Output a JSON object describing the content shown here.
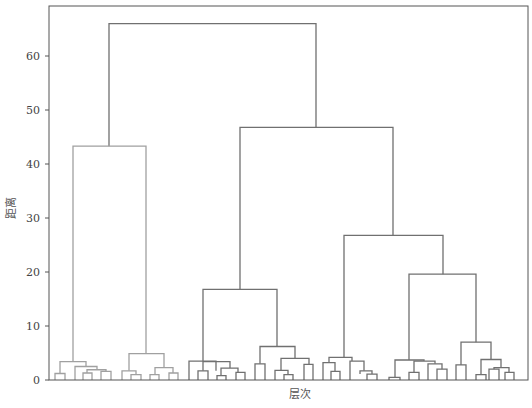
{
  "chart_data": {
    "type": "dendrogram",
    "title": "",
    "xlabel": "层次",
    "ylabel": "距离",
    "ylim": [
      0,
      68
    ],
    "yticks": [
      0,
      10,
      20,
      30,
      40,
      50,
      60
    ],
    "grid": false,
    "legend": null,
    "colors": {
      "cluster_left": "#a0a0a0",
      "cluster_main": "#707070",
      "axis": "#555555"
    },
    "top_merges": [
      {
        "name": "root",
        "height": 66.0
      },
      {
        "name": "left-cluster",
        "height": 43.3
      },
      {
        "name": "right-cluster",
        "height": 46.8
      },
      {
        "name": "right-sub-a",
        "height": 16.8
      },
      {
        "name": "right-sub-b",
        "height": 26.8
      },
      {
        "name": "right-sub-b2",
        "height": 19.6
      },
      {
        "name": "right-sub-a2",
        "height": 6.2
      },
      {
        "name": "right-sub-b2-inner",
        "height": 7.0
      },
      {
        "name": "left-sub-right",
        "height": 4.9
      },
      {
        "name": "left-sub-left",
        "height": 3.5
      }
    ],
    "links": [
      {
        "x1": 109,
        "x2": 316,
        "top": 66.0,
        "b1": 43.3,
        "b2": 46.8,
        "c": "main"
      },
      {
        "x1": 73,
        "x2": 146,
        "top": 43.3,
        "b1": 3.4,
        "b2": 4.9,
        "c": "left"
      },
      {
        "x1": 240,
        "x2": 393,
        "top": 46.8,
        "b1": 16.8,
        "b2": 26.8,
        "c": "main"
      },
      {
        "x1": 203,
        "x2": 277,
        "top": 16.8,
        "b1": 3.5,
        "b2": 6.2,
        "c": "main"
      },
      {
        "x1": 344,
        "x2": 443,
        "top": 26.8,
        "b1": 4.2,
        "b2": 19.6,
        "c": "main"
      },
      {
        "x1": 409,
        "x2": 476,
        "top": 19.6,
        "b1": 3.7,
        "b2": 7.0,
        "c": "main"
      },
      {
        "x1": 60,
        "x2": 86,
        "top": 3.4,
        "b1": 1.2,
        "b2": 2.5,
        "c": "left"
      },
      {
        "x1": 55,
        "x2": 65,
        "top": 1.2,
        "b1": 0,
        "b2": 0,
        "c": "left"
      },
      {
        "x1": 75,
        "x2": 97,
        "top": 2.5,
        "b1": 0,
        "b2": 1.9,
        "c": "left"
      },
      {
        "x1": 87,
        "x2": 106,
        "top": 1.9,
        "b1": 1.3,
        "b2": 1.6,
        "c": "left"
      },
      {
        "x1": 83,
        "x2": 92,
        "top": 1.3,
        "b1": 0,
        "b2": 0,
        "c": "left"
      },
      {
        "x1": 101,
        "x2": 111,
        "top": 1.6,
        "b1": 0,
        "b2": 0,
        "c": "left"
      },
      {
        "x1": 129,
        "x2": 164,
        "top": 4.9,
        "b1": 1.7,
        "b2": 2.3,
        "c": "left"
      },
      {
        "x1": 122,
        "x2": 136,
        "top": 1.7,
        "b1": 0,
        "b2": 1.0,
        "c": "left"
      },
      {
        "x1": 131,
        "x2": 141,
        "top": 1.0,
        "b1": 0,
        "b2": 0,
        "c": "left"
      },
      {
        "x1": 155,
        "x2": 173,
        "top": 2.3,
        "b1": 1.0,
        "b2": 1.3,
        "c": "left"
      },
      {
        "x1": 150,
        "x2": 159,
        "top": 1.0,
        "b1": 0,
        "b2": 0,
        "c": "left"
      },
      {
        "x1": 169,
        "x2": 178,
        "top": 1.3,
        "b1": 0,
        "b2": 0,
        "c": "left"
      },
      {
        "x1": 189,
        "x2": 216,
        "top": 3.5,
        "b1": 0,
        "b2": 1.7,
        "c": "main"
      },
      {
        "x1": 203,
        "x2": 230,
        "top": 3.4,
        "b1": 1.7,
        "b2": 2.2,
        "c": "main"
      },
      {
        "x1": 198,
        "x2": 208,
        "top": 1.7,
        "b1": 0,
        "b2": 0,
        "c": "main"
      },
      {
        "x1": 221,
        "x2": 238,
        "top": 2.2,
        "b1": 0.8,
        "b2": 1.4,
        "c": "main"
      },
      {
        "x1": 217,
        "x2": 226,
        "top": 0.8,
        "b1": 0,
        "b2": 0,
        "c": "main"
      },
      {
        "x1": 236,
        "x2": 245,
        "top": 1.4,
        "b1": 0,
        "b2": 0,
        "c": "main"
      },
      {
        "x1": 260,
        "x2": 295,
        "top": 6.2,
        "b1": 3.0,
        "b2": 4.0,
        "c": "main"
      },
      {
        "x1": 255,
        "x2": 265,
        "top": 3.0,
        "b1": 0,
        "b2": 0,
        "c": "main"
      },
      {
        "x1": 281,
        "x2": 309,
        "top": 4.0,
        "b1": 1.8,
        "b2": 2.9,
        "c": "main"
      },
      {
        "x1": 275,
        "x2": 288,
        "top": 1.8,
        "b1": 0,
        "b2": 1.0,
        "c": "main"
      },
      {
        "x1": 284,
        "x2": 293,
        "top": 1.0,
        "b1": 0,
        "b2": 0,
        "c": "main"
      },
      {
        "x1": 304,
        "x2": 313,
        "top": 2.9,
        "b1": 0,
        "b2": 0,
        "c": "main"
      },
      {
        "x1": 329,
        "x2": 352,
        "top": 4.2,
        "b1": 3.2,
        "b2": 3.5,
        "c": "main"
      },
      {
        "x1": 323,
        "x2": 335,
        "top": 3.2,
        "b1": 0,
        "b2": 1.6,
        "c": "main"
      },
      {
        "x1": 331,
        "x2": 340,
        "top": 1.6,
        "b1": 0,
        "b2": 0,
        "c": "main"
      },
      {
        "x1": 350,
        "x2": 364,
        "top": 3.5,
        "b1": 0,
        "b2": 1.7,
        "c": "main"
      },
      {
        "x1": 360,
        "x2": 372,
        "top": 1.7,
        "b1": 1.1,
        "b2": 1.1,
        "c": "main"
      },
      {
        "x1": 367,
        "x2": 377,
        "top": 1.1,
        "b1": 0,
        "b2": 0,
        "c": "main"
      },
      {
        "x1": 395,
        "x2": 424,
        "top": 3.7,
        "b1": 0.5,
        "b2": 3.5,
        "c": "main"
      },
      {
        "x1": 389,
        "x2": 400,
        "top": 0.5,
        "b1": 0,
        "b2": 0,
        "c": "main"
      },
      {
        "x1": 414,
        "x2": 435,
        "top": 3.5,
        "b1": 1.4,
        "b2": 3.0,
        "c": "main"
      },
      {
        "x1": 409,
        "x2": 419,
        "top": 1.4,
        "b1": 0,
        "b2": 0,
        "c": "main"
      },
      {
        "x1": 428,
        "x2": 442,
        "top": 3.0,
        "b1": 0,
        "b2": 2.0,
        "c": "main"
      },
      {
        "x1": 437,
        "x2": 447,
        "top": 2.0,
        "b1": 0,
        "b2": 0,
        "c": "main"
      },
      {
        "x1": 461,
        "x2": 491,
        "top": 7.0,
        "b1": 2.8,
        "b2": 3.8,
        "c": "main"
      },
      {
        "x1": 456,
        "x2": 466,
        "top": 2.8,
        "b1": 0,
        "b2": 0,
        "c": "main"
      },
      {
        "x1": 481,
        "x2": 501,
        "top": 3.8,
        "b1": 1.0,
        "b2": 2.3,
        "c": "main"
      },
      {
        "x1": 476,
        "x2": 486,
        "top": 1.0,
        "b1": 0,
        "b2": 0,
        "c": "main"
      },
      {
        "x1": 494,
        "x2": 509,
        "top": 2.3,
        "b1": 2.0,
        "b2": 1.4,
        "c": "main"
      },
      {
        "x1": 489,
        "x2": 499,
        "top": 2.0,
        "b1": 0,
        "b2": 0,
        "c": "main"
      },
      {
        "x1": 505,
        "x2": 514,
        "top": 1.4,
        "b1": 0,
        "b2": 0,
        "c": "main"
      }
    ]
  },
  "axes": {
    "y_title": "距离",
    "x_title": "层次",
    "y_tick_labels": [
      "0",
      "10",
      "20",
      "30",
      "40",
      "50",
      "60"
    ]
  }
}
